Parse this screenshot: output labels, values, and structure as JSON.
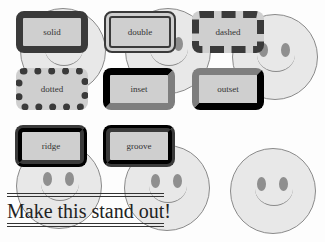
{
  "boxes": [
    {
      "label": "solid",
      "style": "solid"
    },
    {
      "label": "double",
      "style": "double"
    },
    {
      "label": "dashed",
      "style": "dashed"
    },
    {
      "label": "dotted",
      "style": "dotted"
    },
    {
      "label": "inset",
      "style": "inset"
    },
    {
      "label": "outset",
      "style": "outset"
    },
    {
      "label": "ridge",
      "style": "ridge"
    },
    {
      "label": "groove",
      "style": "groove"
    }
  ],
  "headline": {
    "text": "Make this stand out!"
  },
  "colors": {
    "box_fill": "#cfcfcf",
    "border": "#3a3a3a",
    "smiley_fill": "#e8e8e8",
    "smiley_eye": "#8f8f8f",
    "background": "#fdfdfd"
  }
}
